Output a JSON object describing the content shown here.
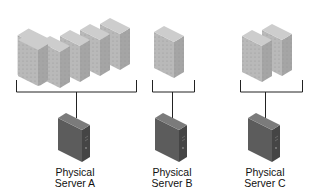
{
  "diagram": {
    "title": "",
    "colors": {
      "vm_front": "#b9b9b9",
      "vm_side": "#a7a7a7",
      "vm_top": "#cfcfcf",
      "server_front": "#5a5a5a",
      "server_side": "#444444",
      "server_top": "#7a7a7a",
      "line": "#222222"
    },
    "groups": [
      {
        "id": "A",
        "vm_count": 5,
        "server_label_line1": "Physical",
        "server_label_line2": "Server A"
      },
      {
        "id": "B",
        "vm_count": 1,
        "server_label_line1": "Physical",
        "server_label_line2": "Server B"
      },
      {
        "id": "C",
        "vm_count": 2,
        "server_label_line1": "Physical",
        "server_label_line2": "Server C"
      }
    ]
  }
}
